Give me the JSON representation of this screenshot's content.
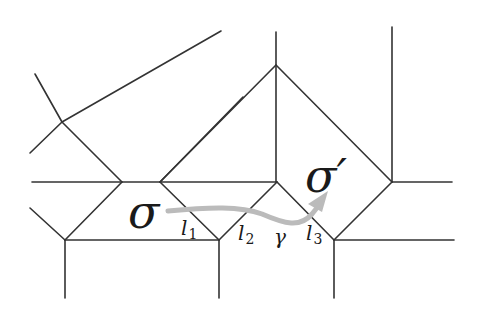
{
  "diagram": {
    "type": "tropical-curve-subdivision",
    "labels": {
      "sigma": "σ",
      "sigma_prime": "σ′",
      "gamma": "γ",
      "l1": "l",
      "l1_sub": "1",
      "l2": "l",
      "l2_sub": "2",
      "l3": "l",
      "l3_sub": "3"
    },
    "colors": {
      "edge": "#333333",
      "path": "#bbbbbb",
      "background": "#ffffff"
    }
  }
}
